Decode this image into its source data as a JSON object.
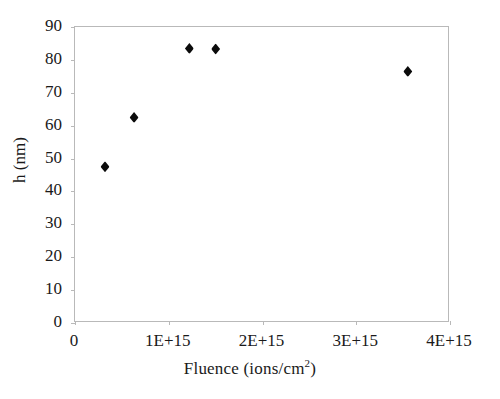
{
  "chart_data": {
    "type": "scatter",
    "title": "",
    "xlabel": "Fluence (ions/cm2)",
    "xlabel_base": "Fluence (ions/cm",
    "xlabel_sup": "2",
    "xlabel_tail": ")",
    "ylabel": "h (nm)",
    "xlim": [
      0,
      4000000000000000.0
    ],
    "ylim": [
      0,
      90
    ],
    "grid": false,
    "legend": "none",
    "marker": "diamond",
    "marker_color": "#0b0b0b",
    "frame_color": "#b9b9b9",
    "xticks": [
      0,
      1000000000000000.0,
      2000000000000000.0,
      3000000000000000.0,
      4000000000000000.0
    ],
    "xtick_labels": [
      "0",
      "1E+15",
      "2E+15",
      "3E+15",
      "4E+15"
    ],
    "yticks": [
      0,
      10,
      20,
      30,
      40,
      50,
      60,
      70,
      80,
      90
    ],
    "ytick_labels": [
      "0",
      "10",
      "20",
      "30",
      "40",
      "50",
      "60",
      "70",
      "80",
      "90"
    ],
    "series": [
      {
        "name": "h vs fluence",
        "points": [
          {
            "x": 320000000000000.0,
            "y": 47.5
          },
          {
            "x": 630000000000000.0,
            "y": 62.5
          },
          {
            "x": 1220000000000000.0,
            "y": 83.5
          },
          {
            "x": 1500000000000000.0,
            "y": 83.3
          },
          {
            "x": 3550000000000000.0,
            "y": 76.5
          }
        ]
      }
    ]
  }
}
